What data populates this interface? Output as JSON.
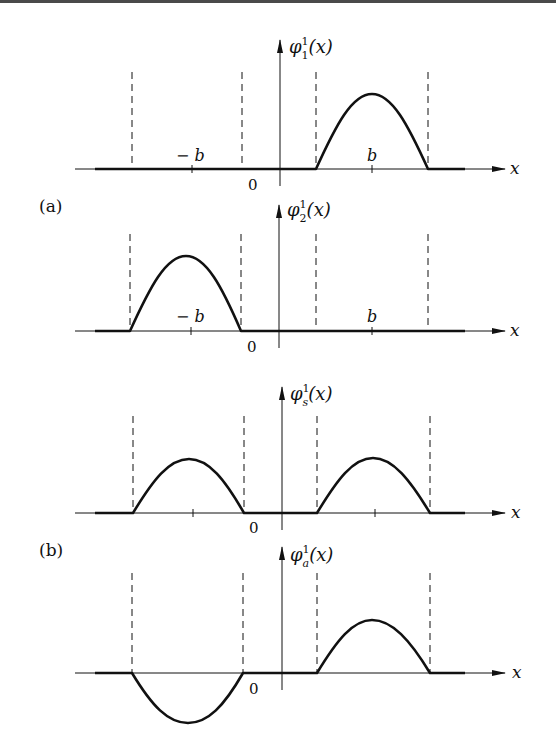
{
  "figure": {
    "panel_labels": {
      "a": "(a)",
      "b": "(b)"
    },
    "x_axis_label": "x",
    "origin_label": "0",
    "tick_labels": {
      "neg_b": "− b",
      "pos_b": "b"
    },
    "plots": [
      {
        "id": "phi1",
        "ylabel": "φ",
        "ylabel_sub": "1",
        "ylabel_sup": "1",
        "ylabel_arg": "(x)",
        "shape": "positive hump centered at +b",
        "show_b_labels": true
      },
      {
        "id": "phi2",
        "ylabel": "φ",
        "ylabel_sub": "2",
        "ylabel_sup": "1",
        "ylabel_arg": "(x)",
        "shape": "positive hump centered at −b",
        "show_b_labels": true
      },
      {
        "id": "phis",
        "ylabel": "φ",
        "ylabel_sub": "s",
        "ylabel_sup": "1",
        "ylabel_arg": "(x)",
        "shape": "positive humps at −b and +b (symmetric)",
        "show_b_labels": false
      },
      {
        "id": "phia",
        "ylabel": "φ",
        "ylabel_sub": "a",
        "ylabel_sup": "1",
        "ylabel_arg": "(x)",
        "shape": "negative hump at −b, positive hump at +b (antisymmetric)",
        "show_b_labels": false
      }
    ]
  }
}
